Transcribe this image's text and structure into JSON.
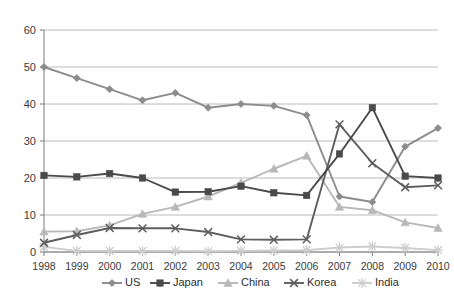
{
  "chart_data": {
    "type": "line",
    "title": "",
    "subtitle": "",
    "xlabel": "",
    "ylabel": "",
    "categories": [
      "1998",
      "1999",
      "2000",
      "2001",
      "2002",
      "2003",
      "2004",
      "2005",
      "2006",
      "2007",
      "2008",
      "2009",
      "2010"
    ],
    "x": [
      1998,
      1999,
      2000,
      2001,
      2002,
      2003,
      2004,
      2005,
      2006,
      2007,
      2008,
      2009,
      2010
    ],
    "ylim": [
      0,
      60
    ],
    "yticks": [
      0,
      10,
      20,
      30,
      40,
      50,
      60
    ],
    "ytick_labels": [
      "0",
      "10",
      "20",
      "30",
      "40",
      "50",
      "60"
    ],
    "grid": true,
    "grid_axis": "y",
    "legend_position": "bottom",
    "series": [
      {
        "name": "US",
        "marker": "diamond",
        "color": "#8c8c8c",
        "values": [
          50,
          47,
          44,
          41,
          43,
          39,
          40,
          39.5,
          37,
          15,
          13.5,
          28.5,
          33.5
        ]
      },
      {
        "name": "Japan",
        "marker": "square",
        "color": "#4a4a4a",
        "values": [
          20.7,
          20.3,
          21.2,
          20,
          16.2,
          16.3,
          17.8,
          16,
          15.3,
          26.5,
          39,
          20.5,
          20
        ]
      },
      {
        "name": "China",
        "marker": "triangle",
        "color": "#b8b8b8",
        "values": [
          5.5,
          5.6,
          7.2,
          10.3,
          12.2,
          15,
          18.7,
          22.5,
          26,
          12.2,
          11.3,
          8,
          6.5
        ]
      },
      {
        "name": "Korea",
        "marker": "cross",
        "color": "#5e5e5e",
        "values": [
          2.5,
          4.6,
          6.5,
          6.4,
          6.4,
          5.4,
          3.4,
          3.3,
          3.4,
          34.5,
          24,
          17.5,
          18
        ]
      },
      {
        "name": "India",
        "marker": "asterisk",
        "color": "#cdcdcd",
        "values": [
          1.4,
          0.3,
          0.3,
          0.3,
          0.3,
          0.2,
          0.3,
          0.4,
          0.5,
          1.2,
          1.5,
          1.1,
          0.5
        ]
      }
    ]
  },
  "legend": {
    "items": [
      {
        "label": "US"
      },
      {
        "label": "Japan"
      },
      {
        "label": "China"
      },
      {
        "label": "Korea"
      },
      {
        "label": "India"
      }
    ]
  }
}
